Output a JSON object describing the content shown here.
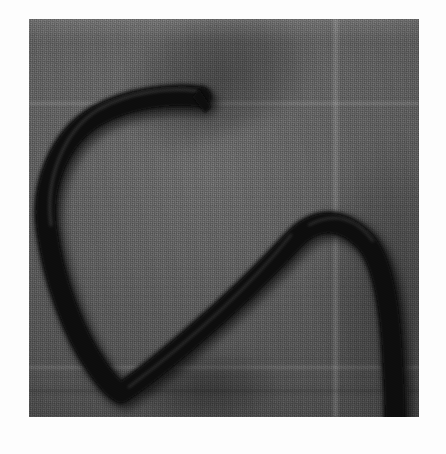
{
  "image": {
    "kind": "photograph",
    "subject": "dark coiled rope on woven cloth",
    "caption_alt": "Black-and-white photograph of a thick dark rope laid in an S-shaped loop on a gray woven fabric background",
    "orientation": "portrait",
    "color_mode": "grayscale",
    "border": {
      "style": "white photographic print border",
      "color": "#fdfdfd"
    },
    "print": {
      "left": 29,
      "top": 19,
      "width": 390,
      "height": 398
    },
    "palette": {
      "paper_white": "#fdfdfd",
      "cloth_light": "#6a6a6a",
      "cloth_mid": "#585858",
      "cloth_dark": "#484848",
      "rope_core": "#0b0b0b",
      "rope_edge": "#232323",
      "shadow": "#2e2e2e"
    },
    "background": {
      "material": "woven fabric",
      "folds": [
        {
          "name": "vertical-fold-right",
          "x": 306,
          "label": "pale vertical crease"
        },
        {
          "name": "horizontal-fold-upper",
          "y": 84,
          "label": "pale horizontal crease"
        },
        {
          "name": "horizontal-fold-lower",
          "y": 348,
          "label": "pale horizontal crease"
        },
        {
          "name": "horizontal-seam-lower",
          "y": 372,
          "label": "dark horizontal seam"
        }
      ]
    },
    "rope": {
      "name": "rope",
      "thickness_px": 19,
      "segments": [
        {
          "name": "upper-free-end",
          "from": [
            172,
            78
          ],
          "to": [
            120,
            82
          ]
        },
        {
          "name": "upper-horizontal-run",
          "from": [
            120,
            82
          ],
          "to": [
            58,
            96
          ]
        },
        {
          "name": "left-descending-bend",
          "from": [
            58,
            96
          ],
          "to": [
            26,
            170
          ]
        },
        {
          "name": "left-long-run",
          "from": [
            26,
            170
          ],
          "to": [
            62,
            330
          ]
        },
        {
          "name": "bottom-v-turn",
          "from": [
            62,
            330
          ],
          "to": [
            88,
            368
          ]
        },
        {
          "name": "diagonal-rise",
          "from": [
            88,
            368
          ],
          "to": [
            282,
            210
          ]
        },
        {
          "name": "right-crest",
          "from": [
            282,
            210
          ],
          "to": [
            348,
            222
          ]
        },
        {
          "name": "right-descending-run",
          "from": [
            348,
            222
          ],
          "to": [
            364,
            398
          ]
        }
      ]
    }
  }
}
